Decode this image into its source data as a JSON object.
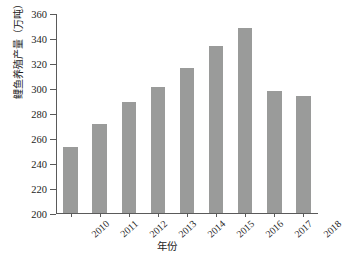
{
  "chart_data": {
    "type": "bar",
    "title": "",
    "xlabel": "年份",
    "ylabel": "鲤鱼养殖产量（万吨）",
    "categories": [
      "2010",
      "2011",
      "2012",
      "2013",
      "2014",
      "2015",
      "2016",
      "2017",
      "2018"
    ],
    "values": [
      253,
      271,
      289,
      301,
      316,
      334,
      348,
      298,
      294
    ],
    "ylim": [
      200,
      360
    ],
    "ytick_labels": [
      "200",
      "220",
      "240",
      "260",
      "280",
      "300",
      "320",
      "340",
      "360"
    ],
    "ytick_values": [
      200,
      220,
      240,
      260,
      280,
      300,
      320,
      340,
      360
    ],
    "grid": false,
    "legend": false,
    "bar_color": "#9a9b9a",
    "axis_color": "#5a5a5a",
    "text_color": "#1d1d1d"
  }
}
